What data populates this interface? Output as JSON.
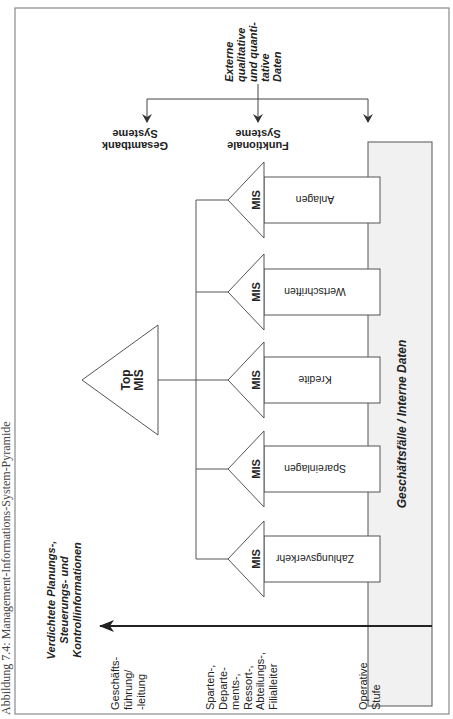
{
  "caption": "Abbildung 7.4:   Management-Informations-System-Pyramide",
  "top_mis": {
    "line1": "Top",
    "line2": "MIS"
  },
  "mis_label": "MIS",
  "functional_units": [
    {
      "label": "Anlagen"
    },
    {
      "label": "Wertschriften"
    },
    {
      "label": "Kredite"
    },
    {
      "label": "Spareinlagen"
    },
    {
      "label": "Zahlungsverkehr"
    }
  ],
  "base_box": {
    "label": "Geschäftsfälle / Interne Daten"
  },
  "external_data": {
    "lines": [
      "Externe",
      "qualitative",
      "und quanti-",
      "tative",
      "Daten"
    ]
  },
  "targets": [
    {
      "line1": "Gesamtbank",
      "line2": "Systeme"
    },
    {
      "line1": "Funktionale",
      "line2": "Systeme"
    }
  ],
  "axis_title": {
    "lines": [
      "Verdichtete Planungs-,",
      "Steuerungs- und",
      "Kontrollinformationen"
    ]
  },
  "levels": [
    {
      "lines": [
        "Geschäfts-",
        "führung/",
        "-leitung"
      ]
    },
    {
      "lines": [
        "Sparten-,",
        "Departe-",
        "ments-,",
        "Ressort-,",
        "Abteilungs-,",
        "Filialleiter"
      ]
    },
    {
      "lines": [
        "Operative",
        "Stufe"
      ]
    }
  ],
  "colors": {
    "line": "#555555",
    "text": "#222222",
    "base_fill": "#f1f1f1",
    "frame": "#8a8a8a"
  }
}
